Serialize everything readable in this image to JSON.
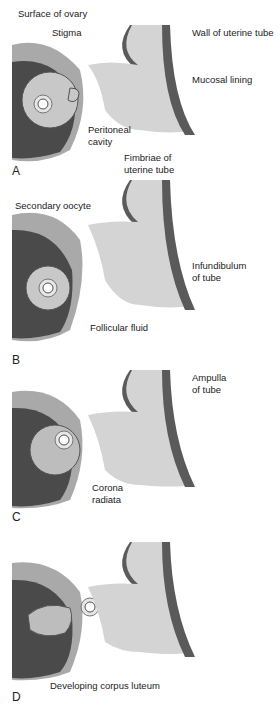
{
  "figure": {
    "panels": [
      {
        "letter": "A",
        "labels": {
          "surface_of_ovary": "Surface of ovary",
          "stigma": "Stigma",
          "wall_of_uterine_tube": "Wall of uterine tube",
          "mucosal_lining": "Mucosal lining",
          "peritoneal_cavity_1": "Peritoneal",
          "peritoneal_cavity_2": "cavity",
          "fimbriae_1": "Fimbriae of",
          "fimbriae_2": "uterine tube"
        }
      },
      {
        "letter": "B",
        "labels": {
          "secondary_oocyte": "Secondary oocyte",
          "infundibulum_1": "Infundibulum",
          "infundibulum_2": "of tube",
          "follicular_fluid": "Follicular fluid"
        }
      },
      {
        "letter": "C",
        "labels": {
          "ampulla_1": "Ampulla",
          "ampulla_2": "of tube",
          "corona_1": "Corona",
          "corona_2": "radiata"
        }
      },
      {
        "letter": "D",
        "labels": {
          "corpus_luteum": "Developing corpus luteum"
        }
      }
    ],
    "colors": {
      "ovary_surface": "#a9a9a9",
      "ovary_dark": "#4a4a4a",
      "tube_wall": "#5a5a5a",
      "mucosa": "#d4d4d4",
      "follicle": "#bdbdbd",
      "leader_line": "#333333"
    }
  }
}
